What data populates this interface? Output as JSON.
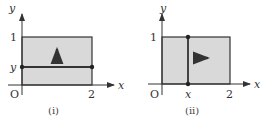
{
  "panels": [
    {
      "caption": "(i)",
      "x_axis_label": "x",
      "y_axis_label": "y",
      "origin_label": "O",
      "x_tick": "2",
      "y_tick": "1",
      "marker_label": "y",
      "sweep_direction": "up"
    },
    {
      "caption": "(ii)",
      "x_axis_label": "x",
      "y_axis_label": "y",
      "origin_label": "O",
      "x_tick": "2",
      "y_tick": "1",
      "marker_label": "x",
      "sweep_direction": "right"
    }
  ],
  "colors": {
    "region_fill": "#d9d9d9",
    "line": "#333333"
  }
}
